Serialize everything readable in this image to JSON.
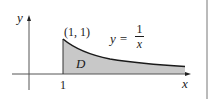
{
  "diagram": {
    "type": "area-under-curve",
    "function": "y = 1/x",
    "axes": {
      "x_label": "x",
      "y_label": "y"
    },
    "tick_labels": {
      "x": [
        "1"
      ]
    },
    "point_label": "(1, 1)",
    "region_label": "D",
    "equation": {
      "lhs": "y =",
      "numerator": "1",
      "denominator": "x"
    },
    "colors": {
      "fill": "#c8c8c8",
      "curve": "#1a1a1a",
      "axis": "#555555",
      "border": "#777777"
    }
  }
}
